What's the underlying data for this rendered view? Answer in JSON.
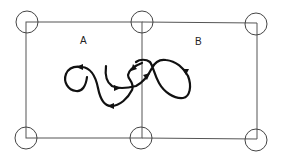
{
  "diagram": {
    "regions": [
      {
        "label": "A"
      },
      {
        "label": "B"
      }
    ],
    "nodes_count": 6,
    "colors": {
      "frame": "#555555",
      "path": "#111111",
      "background": "#ffffff"
    }
  }
}
